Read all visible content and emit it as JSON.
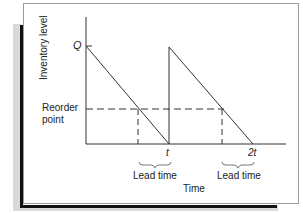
{
  "diagram": {
    "y_axis_label": "Inventory level",
    "x_axis_label": "Time",
    "y_ticks": {
      "q_label": "Q",
      "reorder_line1": "Reorder",
      "reorder_line2": "point"
    },
    "x_ticks": {
      "t_label": "t",
      "two_t_label": "2t"
    },
    "lead_time_labels": [
      "Lead time",
      "Lead time"
    ],
    "colors": {
      "line": "#333333",
      "frame": "#9a9a9a",
      "shadow": "#d9d9d9",
      "accent_bar": "#111111"
    }
  }
}
